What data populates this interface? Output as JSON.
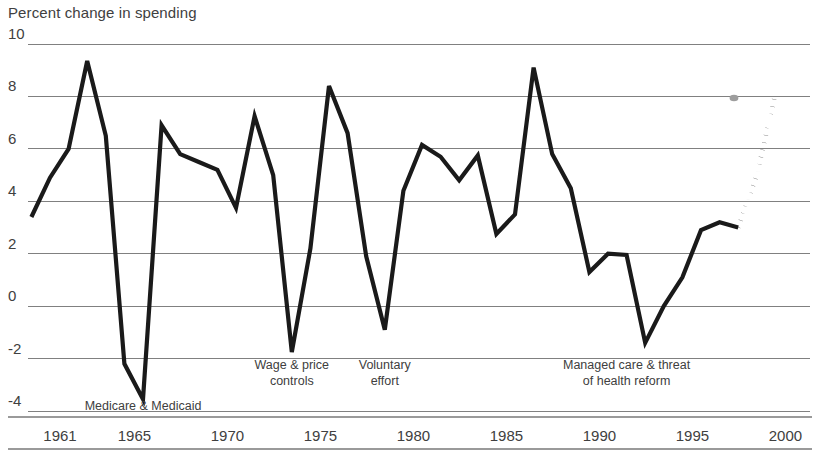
{
  "chart_data": {
    "type": "line",
    "title": "",
    "ylabel": "Percent change in spending",
    "xlabel": "",
    "ylim": [
      -4,
      10
    ],
    "xlim": [
      1960,
      2000
    ],
    "ytick_values": [
      10,
      8,
      6,
      4,
      2,
      0,
      -2,
      -4
    ],
    "ytick_labels": [
      "10",
      "8",
      "6",
      "4",
      "2",
      "0",
      "-2",
      "-4"
    ],
    "xtick_values": [
      1961,
      1965,
      1970,
      1975,
      1980,
      1985,
      1990,
      1995,
      2000
    ],
    "xtick_labels": [
      "1961",
      "1965",
      "1970",
      "1975",
      "1980",
      "1985",
      "1990",
      "1995",
      "2000"
    ],
    "grid": "horizontal",
    "legend": "none",
    "series": [
      {
        "name": "Percent change in spending",
        "style": "solid",
        "color": "#1a1a1a",
        "x": [
          1960,
          1961,
          1962,
          1963,
          1964,
          1965,
          1966,
          1967,
          1968,
          1969,
          1970,
          1971,
          1972,
          1973,
          1974,
          1975,
          1976,
          1977,
          1978,
          1979,
          1980,
          1981,
          1982,
          1983,
          1984,
          1985,
          1986,
          1987,
          1988,
          1989,
          1990,
          1991,
          1992,
          1993,
          1994,
          1995,
          1996,
          1997,
          1998
        ],
        "y": [
          3.4,
          4.9,
          6.0,
          9.35,
          6.5,
          -2.2,
          -3.55,
          6.9,
          5.8,
          5.5,
          5.2,
          3.75,
          7.25,
          5.0,
          -1.75,
          2.2,
          8.4,
          6.6,
          1.9,
          -0.9,
          4.4,
          6.15,
          5.7,
          4.8,
          5.75,
          2.75,
          3.5,
          9.1,
          5.8,
          4.5,
          1.3,
          2.0,
          1.95,
          -1.4,
          0.0,
          1.1,
          2.9,
          3.2,
          3.0
        ]
      },
      {
        "name": "Projection",
        "style": "dotted",
        "color": "#1a1a1a",
        "x": [
          1998,
          1999,
          2000
        ],
        "y": [
          3.0,
          5.0,
          8.1
        ]
      }
    ],
    "annotations": [
      {
        "text": "Medicare & Medicaid",
        "x": 1966,
        "y": -3.85,
        "lines": [
          "Medicare & Medicaid"
        ]
      },
      {
        "text": "Wage & price controls",
        "x": 1974,
        "y": -2.6,
        "lines": [
          "Wage & price",
          "controls"
        ]
      },
      {
        "text": "Voluntary effort",
        "x": 1979,
        "y": -2.6,
        "lines": [
          "Voluntary",
          "effort"
        ]
      },
      {
        "text": "Managed care & threat of health reform",
        "x": 1992,
        "y": -2.6,
        "lines": [
          "Managed care & threat",
          "of health reform"
        ]
      }
    ],
    "artifacts": [
      {
        "name": "gray-smudge",
        "x": 734,
        "y": 98,
        "r": 3.2,
        "color": "#9d9d9d"
      }
    ]
  },
  "geometry": {
    "plot_left": 28,
    "plot_right": 810,
    "grid_top": 44,
    "grid_bottom": 411,
    "x_origin_px": 50,
    "px_per_year": 18.6,
    "frame_top_y": 417,
    "frame_bottom_y": 449
  }
}
